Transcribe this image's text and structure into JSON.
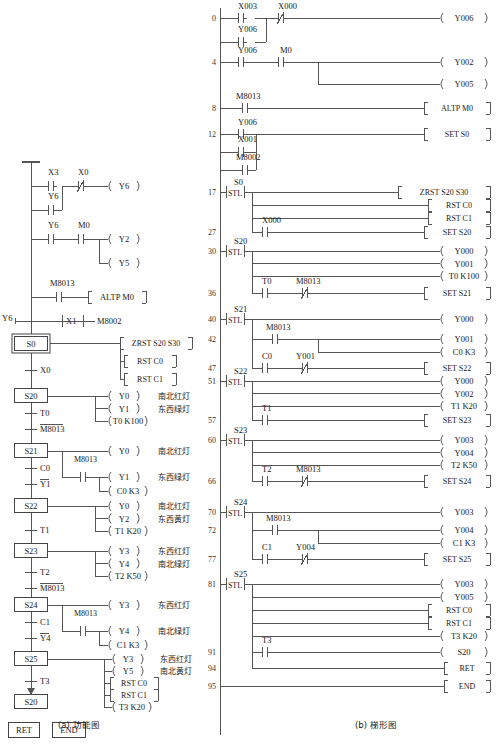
{
  "figure": {
    "caption_a": "(a) 功能图",
    "caption_b": "(b) 梯形图"
  },
  "function_chart": {
    "initial_rungs": [
      {
        "contacts": [
          "X3",
          "Y6"
        ],
        "series": "X0",
        "series_type": "nc",
        "coil": "Y6"
      },
      {
        "contacts": [
          "Y6"
        ],
        "series": "M0",
        "series_type": "no",
        "coils": [
          "Y2",
          "Y5"
        ]
      },
      {
        "contacts": [
          "M8013"
        ],
        "instruction": "ALTP  M0"
      },
      {
        "contacts": [
          "Y6",
          "X1",
          "M8002"
        ],
        "type": "parallel-start"
      }
    ],
    "labels": {
      "x3": "X3",
      "x0": "X0",
      "y6": "Y6",
      "m0": "M0",
      "y2": "Y2",
      "y5": "Y5",
      "m8013": "M8013",
      "altp": "ALTP  M0",
      "x1": "X1",
      "m8002": "M8002"
    },
    "steps": [
      {
        "state": "S0",
        "actions": [
          "ZRST  S20  S30",
          "RST  C0",
          "RST  C1"
        ],
        "action_kinds": [
          "box",
          "box",
          "box"
        ],
        "transition": "X0",
        "transition_overline": false
      },
      {
        "state": "S20",
        "actions": [
          "Y0",
          "Y1",
          "T0  K100"
        ],
        "action_kinds": [
          "coil",
          "coil",
          "coil"
        ],
        "notes": [
          "南北红灯",
          "东西绿灯",
          ""
        ],
        "transitions": [
          {
            "text": "T0",
            "overline": false
          },
          {
            "text": "M8013",
            "overline": true
          }
        ]
      },
      {
        "state": "S21",
        "actions": [
          "Y0",
          "Y1",
          "C0  K3"
        ],
        "action_kinds": [
          "coil",
          "coil",
          "coil"
        ],
        "notes": [
          "南北红灯",
          "东西绿灯",
          ""
        ],
        "branch_contact": "M8013",
        "transitions": [
          {
            "text": "C0",
            "overline": false
          },
          {
            "text": "Y1",
            "overline": true
          }
        ]
      },
      {
        "state": "S22",
        "actions": [
          "Y0",
          "Y2",
          "T1  K20"
        ],
        "action_kinds": [
          "coil",
          "coil",
          "coil"
        ],
        "notes": [
          "南北红灯",
          "东西黄灯",
          ""
        ],
        "transitions": [
          {
            "text": "T1",
            "overline": false
          }
        ]
      },
      {
        "state": "S23",
        "actions": [
          "Y3",
          "Y4",
          "T2  K50"
        ],
        "action_kinds": [
          "coil",
          "coil",
          "coil"
        ],
        "notes": [
          "东西红灯",
          "南北绿灯",
          ""
        ],
        "transitions": [
          {
            "text": "T2",
            "overline": false
          },
          {
            "text": "M8013",
            "overline": true
          }
        ]
      },
      {
        "state": "S24",
        "actions": [
          "Y3",
          "Y4",
          "C1  K3"
        ],
        "action_kinds": [
          "coil",
          "coil",
          "coil"
        ],
        "notes": [
          "东西红灯",
          "南北绿灯",
          ""
        ],
        "branch_contact": "M8013",
        "transitions": [
          {
            "text": "C1",
            "overline": false
          },
          {
            "text": "Y4",
            "overline": true
          }
        ]
      },
      {
        "state": "S25",
        "actions": [
          "Y3",
          "Y5",
          "RST  C0",
          "RST  C1",
          "T3  K20"
        ],
        "action_kinds": [
          "coil",
          "coil",
          "box",
          "box",
          "coil"
        ],
        "notes": [
          "东西红灯",
          "南北黄灯",
          "",
          "",
          ""
        ],
        "transitions": [
          {
            "text": "T3",
            "overline": false
          }
        ]
      },
      {
        "state": "S20",
        "is_return": true
      }
    ],
    "terminators": [
      "RET",
      "END"
    ]
  },
  "ladder": {
    "line_numbers": [
      0,
      4,
      8,
      12,
      17,
      27,
      30,
      36,
      40,
      42,
      47,
      51,
      57,
      60,
      66,
      70,
      72,
      77,
      81,
      91,
      94,
      95
    ],
    "rungs": [
      {
        "n": "0",
        "contacts": [
          {
            "name": "X003",
            "type": "no"
          },
          {
            "name": "X000",
            "type": "nc"
          }
        ],
        "parallel": [
          {
            "name": "Y006",
            "type": "no"
          }
        ],
        "output": "Y006",
        "output_type": "coil"
      },
      {
        "n": "4",
        "contacts": [
          {
            "name": "Y006",
            "type": "no"
          },
          {
            "name": "M0",
            "type": "no"
          }
        ],
        "outputs": [
          "Y002",
          "Y005"
        ],
        "output_type": "coil"
      },
      {
        "n": "8",
        "contacts": [
          {
            "name": "M8013",
            "type": "no"
          }
        ],
        "output": "ALTP   M0",
        "output_type": "box"
      },
      {
        "n": "12",
        "contacts": [
          {
            "name": "Y006",
            "type": "no"
          }
        ],
        "parallel": [
          {
            "name": "X001",
            "type": "no"
          },
          {
            "name": "M8002",
            "type": "no"
          }
        ],
        "output": "SET    S0",
        "output_type": "box"
      },
      {
        "n": "17",
        "stl": "S0",
        "outputs_box": [
          "ZRST   S20  S30",
          "RST    C0",
          "RST    C1"
        ],
        "branch": {
          "n": "27",
          "contact": "X000",
          "type": "no",
          "output": "SET    S20",
          "output_type": "box"
        }
      },
      {
        "n": "30",
        "stl": "S20",
        "outputs_coil": [
          "Y000",
          "Y001",
          "T0   K100"
        ],
        "branch": {
          "n": "36",
          "contacts": [
            {
              "name": "T0",
              "type": "no"
            },
            {
              "name": "M8013",
              "type": "nc"
            }
          ],
          "output": "SET    S21",
          "output_type": "box"
        }
      },
      {
        "n": "40",
        "stl": "S21",
        "outputs_coil": [
          "Y000",
          "Y001",
          "C0   K3"
        ],
        "sub_n": "42",
        "sub_contact": "M8013",
        "branch": {
          "n": "47",
          "contacts": [
            {
              "name": "C0",
              "type": "no"
            },
            {
              "name": "Y001",
              "type": "nc"
            }
          ],
          "output": "SET    S22",
          "output_type": "box"
        }
      },
      {
        "n": "51",
        "stl": "S22",
        "outputs_coil": [
          "Y000",
          "Y002",
          "T1   K20"
        ],
        "branch": {
          "n": "57",
          "contacts": [
            {
              "name": "T1",
              "type": "no"
            }
          ],
          "output": "SET    S23",
          "output_type": "box"
        }
      },
      {
        "n": "60",
        "stl": "S23",
        "outputs_coil": [
          "Y003",
          "Y004",
          "T2   K50"
        ],
        "branch": {
          "n": "66",
          "contacts": [
            {
              "name": "T2",
              "type": "no"
            },
            {
              "name": "M8013",
              "type": "nc"
            }
          ],
          "output": "SET    S24",
          "output_type": "box"
        }
      },
      {
        "n": "70",
        "stl": "S24",
        "outputs_coil": [
          "Y003",
          "Y004",
          "C1   K3"
        ],
        "sub_n": "72",
        "sub_contact": "M8013",
        "branch": {
          "n": "77",
          "contacts": [
            {
              "name": "C1",
              "type": "no"
            },
            {
              "name": "Y004",
              "type": "nc"
            }
          ],
          "output": "SET    S25",
          "output_type": "box"
        }
      },
      {
        "n": "81",
        "stl": "S25",
        "outputs_coil": [
          "Y003",
          "Y005"
        ],
        "outputs_box": [
          "RST    C0",
          "RST    C1"
        ],
        "outputs_coil2": [
          "T3   K20"
        ],
        "branch": {
          "n": "91",
          "contacts": [
            {
              "name": "T3",
              "type": "no"
            }
          ],
          "output": "S20",
          "output_type": "coil"
        }
      },
      {
        "n": "94",
        "output": "RET",
        "output_type": "box"
      },
      {
        "n": "95",
        "output": "END",
        "output_type": "box"
      }
    ]
  },
  "colors": {
    "line": "#555555",
    "text": "#1a1a1a",
    "number": "#333333"
  }
}
